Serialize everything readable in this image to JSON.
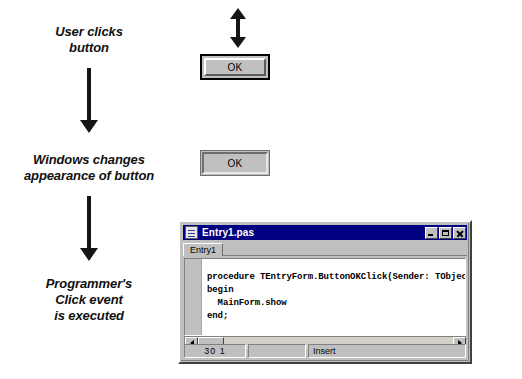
{
  "diagram": {
    "steps": [
      {
        "caption": "User clicks\nbutton"
      },
      {
        "caption": "Windows changes\nappearance of button"
      },
      {
        "caption": "Programmer's\nClick event\nis executed"
      }
    ],
    "flow_arrows": [
      {
        "name": "arrow-step1-to-step2",
        "direction": "down"
      },
      {
        "name": "arrow-step2-to-step3",
        "direction": "down"
      }
    ],
    "press_arrow": {
      "name": "up-down-arrow",
      "direction": "up-down"
    }
  },
  "buttons": {
    "normal": {
      "label": "OK",
      "state": "default-focused"
    },
    "pressed": {
      "label": "OK",
      "state": "pressed"
    }
  },
  "code_window": {
    "title": "Entry1.pas",
    "doc_icon": "document-icon",
    "controls": {
      "minimize": "minimize-icon",
      "maximize": "maximize-icon",
      "close": "close-icon"
    },
    "tabs": [
      {
        "label": "Entry1",
        "active": true
      }
    ],
    "code_lines": [
      "procedure TEntryForm.ButtonOKClick(Sender: TObject);",
      "begin",
      "  MainForm.show",
      "end;"
    ],
    "scrollbar": {
      "left_arrow": "scroll-left-icon",
      "right_arrow": "scroll-right-icon"
    },
    "statusbar": {
      "position": "30   1",
      "middle": "",
      "mode": "Insert"
    }
  },
  "colors": {
    "titlebar": "#000080",
    "face": "#c0c0c0",
    "editor_background": "#ffffff",
    "ink": "#151515"
  }
}
